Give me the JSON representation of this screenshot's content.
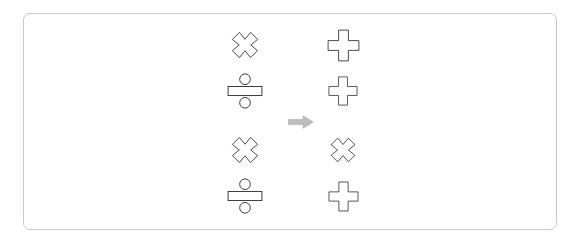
{
  "canvas": {
    "width": 581,
    "height": 243,
    "background_color": "#ffffff"
  },
  "card": {
    "name": "puzzle-card",
    "border_color": "#c9c9c9",
    "background_color": "#ffffff",
    "corner_radius_px": 7,
    "x": 23,
    "y": 13,
    "width": 534,
    "height": 217
  },
  "puzzle": {
    "type": "symbol-mapping",
    "description": "Two vertical columns of mathematical operator glyphs separated by a rightward arrow.",
    "stroke_color": "#2b2b2b",
    "fill_color": "#ffffff",
    "arrow": {
      "name": "right-arrow",
      "symbol": "right-arrow-icon",
      "label": "⇒",
      "color": "#bdbdbd",
      "outline_color": "#8a8a8a",
      "x": 288,
      "y": 115,
      "width": 26,
      "height": 13
    },
    "columns": [
      {
        "name": "left-column",
        "side": "left",
        "center_x": 245,
        "items": [
          {
            "row": 1,
            "symbol": "multiply",
            "glyph": "✕",
            "icon_name": "multiply-icon",
            "center_y": 45,
            "size": 36
          },
          {
            "row": 2,
            "symbol": "divide",
            "glyph": "÷",
            "icon_name": "divide-icon",
            "center_y": 91,
            "size": 36
          },
          {
            "row": 3,
            "symbol": "multiply",
            "glyph": "✕",
            "icon_name": "multiply-icon",
            "center_y": 150,
            "size": 36
          },
          {
            "row": 4,
            "symbol": "divide",
            "glyph": "÷",
            "icon_name": "divide-icon",
            "center_y": 196,
            "size": 36
          }
        ]
      },
      {
        "name": "right-column",
        "side": "right",
        "center_x": 343,
        "items": [
          {
            "row": 1,
            "symbol": "plus",
            "glyph": "✚",
            "icon_name": "plus-icon",
            "center_y": 45,
            "size": 35
          },
          {
            "row": 2,
            "symbol": "plus",
            "glyph": "✚",
            "icon_name": "plus-icon",
            "center_y": 91,
            "size": 32
          },
          {
            "row": 3,
            "symbol": "multiply",
            "glyph": "✕",
            "icon_name": "multiply-icon",
            "center_y": 150,
            "size": 34
          },
          {
            "row": 4,
            "symbol": "plus",
            "glyph": "✚",
            "icon_name": "plus-icon",
            "center_y": 196,
            "size": 33
          }
        ]
      }
    ]
  }
}
